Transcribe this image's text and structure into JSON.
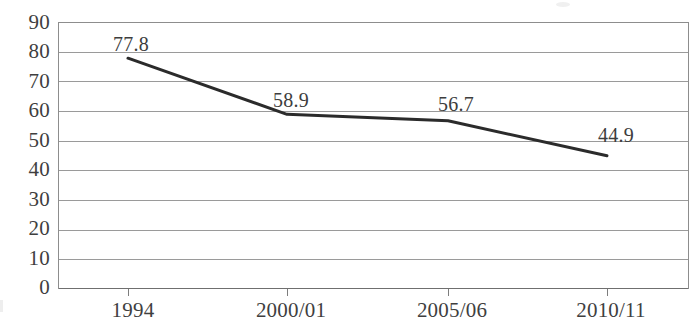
{
  "chart_data": {
    "type": "line",
    "title": "",
    "subtitle": "",
    "xlabel": "",
    "ylabel": "",
    "categories": [
      "1994",
      "2000/01",
      "2005/06",
      "2010/11"
    ],
    "values": [
      77.8,
      58.9,
      56.7,
      44.9
    ],
    "series": [
      {
        "name": "",
        "values": [
          77.8,
          58.9,
          56.7,
          44.9
        ],
        "color": "#2b2b2b",
        "line_width": 3,
        "markers": false
      }
    ],
    "data_labels": [
      "77.8",
      "58.9",
      "56.7",
      "44.9"
    ],
    "ylim": [
      0,
      90
    ],
    "ytick_step": 10,
    "ytick_labels": [
      "90",
      "80",
      "70",
      "60",
      "50",
      "40",
      "30",
      "20",
      "10",
      "0"
    ],
    "ytick_values": [
      90,
      80,
      70,
      60,
      50,
      40,
      30,
      20,
      10,
      0
    ],
    "xtick_labels": [
      "1994",
      "2000/01",
      "2005/06",
      "2010/11"
    ],
    "grid": {
      "horizontal": true,
      "vertical": false,
      "color": "#9a9a9a"
    },
    "legend": {
      "visible": false,
      "position": "none",
      "entries": []
    },
    "axis": {
      "left_border": true,
      "right_border": true,
      "bottom_border": true,
      "top_border": true,
      "color": "#8d8d8d"
    },
    "annotations": []
  }
}
